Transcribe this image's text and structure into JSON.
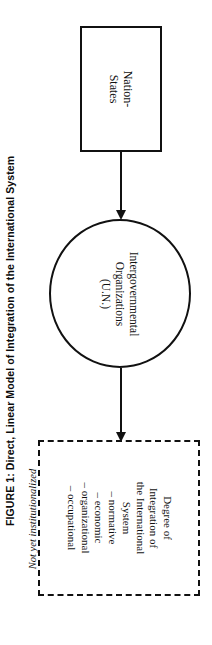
{
  "page": {
    "running_head": "INTERNATIONAL ORGANIZATIONS",
    "caption": "FIGURE 1: Direct, Linear Model of Integration of the International System"
  },
  "diagram": {
    "nodes": {
      "nation_states": {
        "label_line_1": "Nation-",
        "label_line_2": "States"
      },
      "intergovernmental_organizations": {
        "label_line_1": "Intergovernmental",
        "label_line_2": "Organizations",
        "label_line_3": "(U.N.)"
      },
      "degree_of_integration": {
        "heading_line_1": "Degree of",
        "heading_line_2": "Integration of",
        "heading_line_3": "the International",
        "heading_line_4": "System",
        "items": [
          "– normative",
          "– economic",
          "– organizational",
          "– occupational"
        ]
      }
    },
    "annotations": {
      "not_institutionalized": "Not yet institutionalized"
    }
  }
}
